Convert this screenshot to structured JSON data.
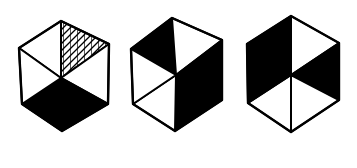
{
  "figure": {
    "colors": {
      "fill_dark": "#000000",
      "fill_light": "#ffffff",
      "stroke": "#000000",
      "background": "#ffffff"
    },
    "hexagons": [
      {
        "id": "hexagon-1",
        "vertices": {
          "top": [
            61,
            21
          ],
          "upper_left": [
            19,
            48
          ],
          "upper_right": [
            109,
            44
          ],
          "center": [
            61,
            78
          ],
          "lower_left": [
            22,
            104
          ],
          "lower_right": [
            108,
            104
          ],
          "bottom": [
            62,
            131
          ]
        },
        "triangles": {
          "top_left": "white",
          "top_right": "hatched",
          "right": "white",
          "bottom_right": "black",
          "bottom_left": "black",
          "left": "white"
        }
      },
      {
        "id": "hexagon-2",
        "vertices": {
          "top": [
            172,
            18
          ],
          "upper_left": [
            131,
            49
          ],
          "upper_right": [
            222,
            40
          ],
          "center": [
            176,
            75
          ],
          "lower_left": [
            133,
            104
          ],
          "lower_right": [
            222,
            100
          ],
          "bottom": [
            175,
            131
          ]
        },
        "triangles": {
          "top_left": "black",
          "top_right": "white",
          "right": "black",
          "bottom_right": "black",
          "bottom_left": "white",
          "left": "white"
        }
      },
      {
        "id": "hexagon-3",
        "vertices": {
          "top": [
            291,
            16
          ],
          "upper_left": [
            247,
            44
          ],
          "upper_right": [
            339,
            43
          ],
          "center": [
            291,
            75
          ],
          "lower_left": [
            248,
            103
          ],
          "lower_right": [
            339,
            100
          ],
          "bottom": [
            291,
            132
          ]
        },
        "triangles": {
          "top_left": "black",
          "top_right": "white",
          "right": "black",
          "bottom_right": "white",
          "bottom_left": "white",
          "left": "black"
        }
      }
    ]
  }
}
